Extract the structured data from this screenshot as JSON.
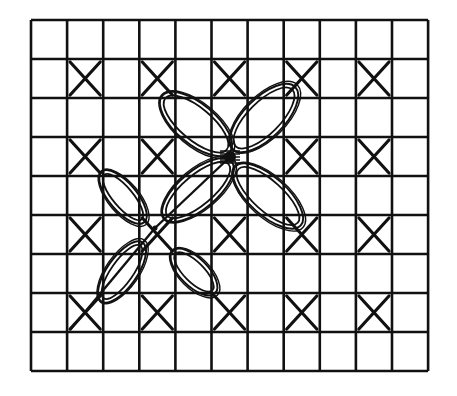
{
  "diagram": {
    "type": "embroidery-stitch-pattern",
    "colors": {
      "ink": "#111111",
      "background": "#ffffff"
    },
    "grid": {
      "x0": 31,
      "y0": 20,
      "cols": 11,
      "rows": 9,
      "cell_w": 36.1,
      "cell_h": 39
    },
    "cross_stitches": [
      {
        "col": 1,
        "row": 1
      },
      {
        "col": 3,
        "row": 1
      },
      {
        "col": 5,
        "row": 1
      },
      {
        "col": 7,
        "row": 1
      },
      {
        "col": 9,
        "row": 1
      },
      {
        "col": 1,
        "row": 3
      },
      {
        "col": 3,
        "row": 3
      },
      {
        "col": 7,
        "row": 3
      },
      {
        "col": 9,
        "row": 3
      },
      {
        "col": 1,
        "row": 5
      },
      {
        "col": 3,
        "row": 5
      },
      {
        "col": 5,
        "row": 5
      },
      {
        "col": 7,
        "row": 5
      },
      {
        "col": 9,
        "row": 5
      },
      {
        "col": 1,
        "row": 7
      },
      {
        "col": 3,
        "row": 7
      },
      {
        "col": 5,
        "row": 7
      },
      {
        "col": 7,
        "row": 7
      },
      {
        "col": 9,
        "row": 7
      }
    ],
    "large_flower": {
      "center": [
        230,
        157
      ],
      "petals": [
        {
          "cx": 196,
          "cy": 124,
          "rx": 44,
          "ry": 20,
          "angle": 40
        },
        {
          "cx": 264,
          "cy": 118,
          "rx": 44,
          "ry": 20,
          "angle": -45
        },
        {
          "cx": 198,
          "cy": 190,
          "rx": 44,
          "ry": 19,
          "angle": -40
        },
        {
          "cx": 268,
          "cy": 196,
          "rx": 44,
          "ry": 19,
          "angle": 42
        }
      ]
    },
    "small_flower": {
      "center": [
        155,
        228
      ],
      "petals": [
        {
          "cx": 123,
          "cy": 197,
          "rx": 33,
          "ry": 14,
          "angle": 50
        },
        {
          "cx": 122,
          "cy": 272,
          "rx": 36,
          "ry": 15,
          "angle": -55
        },
        {
          "cx": 194,
          "cy": 272,
          "rx": 30,
          "ry": 14,
          "angle": 45
        }
      ]
    },
    "stems": [
      {
        "x1": 230,
        "y1": 157,
        "x2": 155,
        "y2": 228
      },
      {
        "x1": 155,
        "y1": 228,
        "x2": 70,
        "y2": 330
      }
    ]
  }
}
